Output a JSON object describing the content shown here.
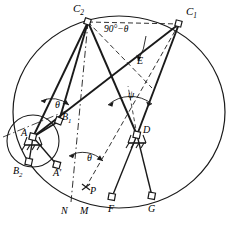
{
  "figure": {
    "type": "geometric-kinematic-diagram",
    "width": 239,
    "height": 229,
    "stroke_color": "#1a1a1a",
    "background_color": "#ffffff"
  },
  "labels": {
    "c2": {
      "base": "C",
      "sub": "2",
      "x": 73,
      "y": 4
    },
    "c1": {
      "base": "C",
      "sub": "1",
      "x": 186,
      "y": 8
    },
    "angle_90_minus_theta": {
      "text": "90°−θ",
      "x": 107,
      "y": 26
    },
    "e": {
      "base": "E",
      "sub": "",
      "x": 137,
      "y": 57
    },
    "psi": {
      "base": "ψ",
      "sub": "",
      "x": 128,
      "y": 93
    },
    "theta_upper": {
      "base": "θ",
      "sub": "",
      "x": 56,
      "y": 103
    },
    "b1": {
      "base": "B",
      "sub": "1",
      "x": 61,
      "y": 113
    },
    "a": {
      "base": "A",
      "sub": "",
      "x": 23,
      "y": 129
    },
    "d": {
      "base": "D",
      "sub": "",
      "x": 143,
      "y": 126
    },
    "b2": {
      "base": "B",
      "sub": "2",
      "x": 14,
      "y": 167
    },
    "a_prime": {
      "base": "A′",
      "sub": "",
      "x": 53,
      "y": 169
    },
    "theta_lower": {
      "base": "θ",
      "sub": "",
      "x": 88,
      "y": 155
    },
    "p": {
      "base": "P",
      "sub": "",
      "x": 89,
      "y": 190
    },
    "n": {
      "base": "N",
      "sub": "",
      "x": 62,
      "y": 208
    },
    "m": {
      "base": "M",
      "sub": "",
      "x": 81,
      "y": 208
    },
    "f": {
      "base": "F",
      "sub": "",
      "x": 108,
      "y": 206
    },
    "g": {
      "base": "G",
      "sub": "",
      "x": 148,
      "y": 206
    }
  },
  "points": {
    "C2": {
      "x": 88,
      "y": 22
    },
    "C1": {
      "x": 179,
      "y": 24
    },
    "E": {
      "x": 132,
      "y": 63
    },
    "A": {
      "x": 33,
      "y": 137
    },
    "B1": {
      "x": 59,
      "y": 121
    },
    "B2": {
      "x": 29,
      "y": 162
    },
    "A_prime": {
      "x": 57,
      "y": 165
    },
    "D": {
      "x": 137,
      "y": 135
    },
    "P": {
      "x": 86,
      "y": 187
    },
    "M": {
      "x": 85,
      "y": 198
    },
    "N": {
      "x": 71,
      "y": 200
    },
    "F": {
      "x": 112,
      "y": 197
    },
    "G": {
      "x": 152,
      "y": 196
    }
  },
  "circles": {
    "main": {
      "cx": 119,
      "cy": 112,
      "rx": 107,
      "ry": 96
    },
    "small": {
      "cx": 33,
      "cy": 141,
      "rx": 26,
      "ry": 26
    }
  },
  "caption": ""
}
